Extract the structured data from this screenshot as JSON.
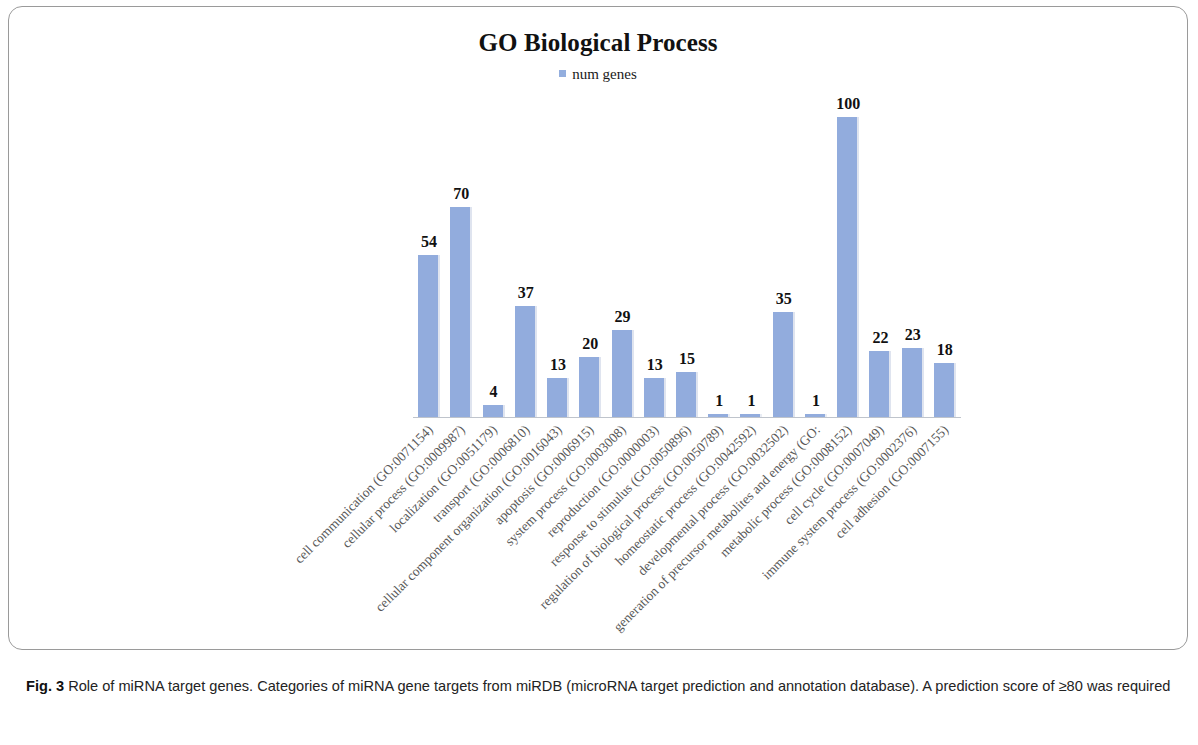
{
  "figure": {
    "frame_border_color": "#9a9a9a",
    "caption_label": "Fig. 3",
    "caption_text": "Role of miRNA target genes. Categories of miRNA gene targets from miRDB (microRNA target prediction and annotation database). A prediction score of ≥80 was required"
  },
  "chart_data": {
    "type": "bar",
    "title": "GO Biological Process",
    "subtitle": "",
    "xlabel": "",
    "ylabel": "",
    "ylim": [
      0,
      100
    ],
    "grid": false,
    "legend_position": "top-center",
    "bar_color": "#92acdd",
    "bar_shadow_color": "#dfe4ef",
    "value_labels_shown": true,
    "axis_line_color": "#bfc4cc",
    "series": [
      {
        "name": "num genes",
        "values": [
          54,
          70,
          4,
          37,
          13,
          20,
          29,
          13,
          15,
          1,
          1,
          35,
          1,
          100,
          22,
          23,
          18
        ]
      }
    ],
    "categories": [
      "cell communication (GO:0071154)",
      "cellular process (GO:0009987)",
      "localization (GO:0051179)",
      "transport (GO:0006810)",
      "cellular component organization (GO:0016043)",
      "apoptosis (GO:0006915)",
      "system process (GO:0003008)",
      "reproduction (GO:0000003)",
      "response to stimulus (GO:0050896)",
      "regulation of biological process (GO:0050789)",
      "homeostatic process (GO:0042592)",
      "developmental process (GO:0032502)",
      "generation of precursor metabolites and energy (GO:",
      "metabolic process (GO:0008152)",
      "cell cycle (GO:0007049)",
      "immune system process (GO:0002376)",
      "cell adhesion (GO:0007155)"
    ]
  }
}
